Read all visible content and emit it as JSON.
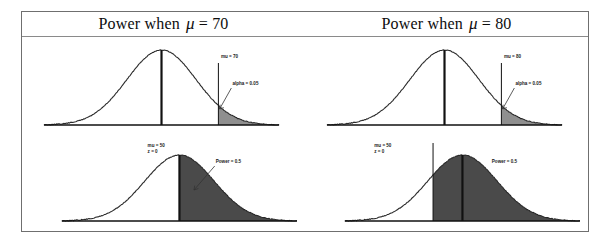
{
  "figure": {
    "caption_left": "Power when",
    "caption_right": "Power when"
  },
  "columns": [
    {
      "id": "mu70",
      "title_prefix": "Power when",
      "title_symbol": "μ",
      "title_eq": "= 70",
      "title_full": "Power when μ = 70",
      "top": {
        "center_label": "mu = 70",
        "tail_label": "alpha = 0.05"
      },
      "bottom": {
        "center_label_line1": "mu = 50",
        "center_label_line2": "z = 0",
        "power_label": "Power = 0.5"
      }
    },
    {
      "id": "mu80",
      "title_prefix": "Power when",
      "title_symbol": "μ",
      "title_eq": "= 80",
      "title_full": "Power when μ = 80",
      "top": {
        "center_label": "mu = 80",
        "tail_label": "alpha = 0.05"
      },
      "bottom": {
        "center_label_line1": "mu = 50",
        "center_label_line2": "z = 0",
        "power_label": "Power = 0.5"
      }
    }
  ],
  "chart_data": {
    "type": "line",
    "xlabel": "",
    "ylabel": "",
    "grid": false,
    "legend": null,
    "panels": [
      {
        "panel": "top-left",
        "column": "Power when μ = 70",
        "curve": "normal",
        "mean": 0.0,
        "sd": 1.0,
        "xlim": [
          -3.4,
          3.4
        ],
        "center_line_at": 0.0,
        "center_line_label": "mu = 70",
        "critical_value": 1.645,
        "shaded_region": "right-tail",
        "shaded_from": 1.645,
        "shaded_to": 3.4,
        "shaded_area": 0.05,
        "shade_color": "#8f8f8f",
        "annotation": "alpha = 0.05"
      },
      {
        "panel": "bottom-left",
        "column": "Power when μ = 70",
        "curve": "normal",
        "mean": 0.0,
        "sd": 1.0,
        "xlim": [
          -3.4,
          3.4
        ],
        "center_line_at": 0.0,
        "center_line_label": "mu = 50, z = 0",
        "critical_value": 0.0,
        "shaded_region": "right-of-center",
        "shaded_from": 0.0,
        "shaded_to": 3.4,
        "shaded_area": 0.5,
        "shade_color": "#4a4a4a",
        "annotation": "Power = 0.5"
      },
      {
        "panel": "top-right",
        "column": "Power when μ = 80",
        "curve": "normal",
        "mean": 0.0,
        "sd": 1.0,
        "xlim": [
          -3.4,
          3.4
        ],
        "center_line_at": 0.0,
        "center_line_label": "mu = 80",
        "critical_value": 1.645,
        "shaded_region": "right-tail",
        "shaded_from": 1.645,
        "shaded_to": 3.4,
        "shaded_area": 0.05,
        "shade_color": "#8f8f8f",
        "annotation": "alpha = 0.05"
      },
      {
        "panel": "bottom-right",
        "column": "Power when μ = 80",
        "curve": "normal",
        "mean": 0.0,
        "sd": 1.0,
        "xlim": [
          -3.4,
          3.4
        ],
        "center_line_at": 0.0,
        "center_line_label": "mu = 50, z = 0",
        "critical_value": -0.85,
        "shaded_region": "right-of-cutoff",
        "shaded_from": -0.85,
        "shaded_to": 3.4,
        "shaded_area": 0.5,
        "shade_color": "#4a4a4a",
        "annotation": "Power = 0.5"
      }
    ]
  },
  "colors": {
    "frame_border": "#6f6f6f",
    "header_rule": "#8a8a8a",
    "curve_stroke": "#2a2a2a",
    "axis": "#111111",
    "alpha_shade": "#8f8f8f",
    "power_shade": "#4a4a4a",
    "text": "#0d0d0d"
  }
}
